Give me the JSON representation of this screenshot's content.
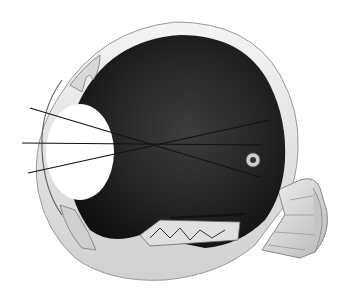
{
  "image": {
    "subject": "Anatomical cross-section of the human eye",
    "description": "Engraved illustration showing the eyeball cut open with lens, vitreous chamber, retina, optic nerve and light rays converging onto the retina",
    "colors": {
      "background": "#ffffff",
      "interior_dark": "#1a1a1a",
      "interior_mid": "#3a3a3a",
      "sclera": "#e6e6e6",
      "sclera_shade": "#bdbdbd",
      "lens": "#ffffff",
      "lines": "#111111"
    }
  }
}
